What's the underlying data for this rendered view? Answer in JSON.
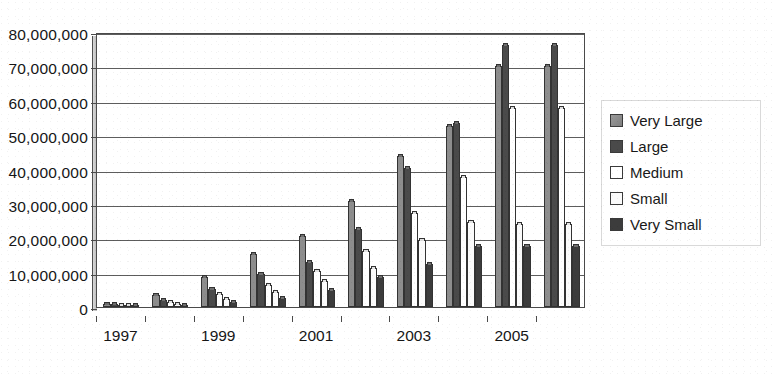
{
  "chart_data": {
    "type": "bar",
    "title": "",
    "subtitle": "",
    "xlabel": "",
    "ylabel": "",
    "grid": true,
    "legend_position": "right",
    "ylim": [
      0,
      80000000
    ],
    "y_ticks": [
      0,
      10000000,
      20000000,
      30000000,
      40000000,
      50000000,
      60000000,
      70000000,
      80000000
    ],
    "y_tick_labels": [
      "0",
      "10,000,000",
      "20,000,000",
      "30,000,000",
      "40,000,000",
      "50,000,000",
      "60,000,000",
      "70,000,000",
      "80,000,000"
    ],
    "categories": [
      "1997",
      "1998",
      "1999",
      "2000",
      "2001",
      "2002",
      "2003",
      "2004",
      "2005",
      "2006"
    ],
    "x_tick_labels_shown": [
      "1997",
      "1999",
      "2001",
      "2003",
      "2005"
    ],
    "series": [
      {
        "name": "Very Large",
        "color": "#8d8d8d",
        "values": [
          900000,
          3600000,
          8800000,
          15300000,
          20800000,
          30800000,
          43800000,
          52800000,
          70200000,
          70200000
        ]
      },
      {
        "name": "Large",
        "color": "#4a4a4a",
        "values": [
          800000,
          2000000,
          5200000,
          9600000,
          13100000,
          22600000,
          40300000,
          53600000,
          76200000,
          76200000
        ]
      },
      {
        "name": "Medium",
        "color": "#ffffff",
        "values": [
          600000,
          1400000,
          3800000,
          6300000,
          10500000,
          16400000,
          27400000,
          37800000,
          57800000,
          57800000
        ]
      },
      {
        "name": "Small",
        "color": "#ffffff",
        "values": [
          450000,
          900000,
          2400000,
          4300000,
          7600000,
          11300000,
          19400000,
          24600000,
          24200000,
          24200000
        ]
      },
      {
        "name": "Very Small",
        "color": "#3c3c3c",
        "values": [
          300000,
          600000,
          1600000,
          2600000,
          5000000,
          8700000,
          12600000,
          17700000,
          17700000,
          17700000
        ]
      }
    ]
  },
  "legend": {
    "items": [
      {
        "label": "Very Large",
        "swatch": "#8d8d8d"
      },
      {
        "label": "Large",
        "swatch": "#4a4a4a"
      },
      {
        "label": "Medium",
        "swatch": "#ffffff"
      },
      {
        "label": "Small",
        "swatch": "#fbfbfb"
      },
      {
        "label": "Very Small",
        "swatch": "#3c3c3c"
      }
    ]
  }
}
